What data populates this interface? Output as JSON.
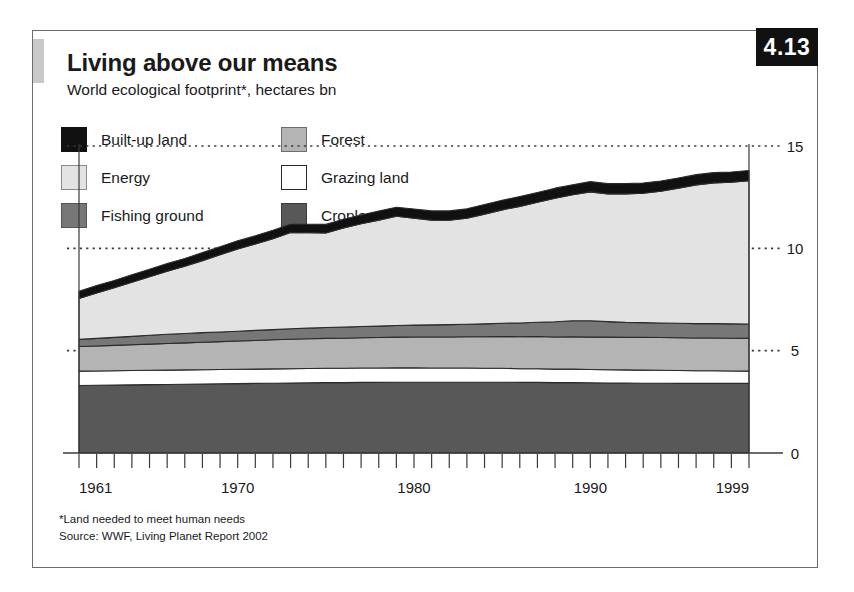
{
  "badge": {
    "number": "4.13"
  },
  "header": {
    "title": "Living above our means",
    "subtitle": "World ecological footprint*, hectares bn"
  },
  "legend": {
    "items": [
      {
        "label": "Built-up land",
        "color": "#111111",
        "border": "#111111"
      },
      {
        "label": "Forest",
        "color": "#b4b4b4",
        "border": "#6d6d6d"
      },
      {
        "label": "Energy",
        "color": "#e3e3e3",
        "border": "#8a8a8a"
      },
      {
        "label": "Grazing land",
        "color": "#ffffff",
        "border": "#2b2b2b"
      },
      {
        "label": "Fishing ground",
        "color": "#777777",
        "border": "#555555"
      },
      {
        "label": "Cropland",
        "color": "#585858",
        "border": "#3a3a3a"
      }
    ]
  },
  "footnotes": {
    "line1": "*Land needed to meet human needs",
    "line2": "Source: WWF, Living Planet Report 2002"
  },
  "chart_data": {
    "type": "area",
    "stacked": true,
    "title": "Living above our means",
    "subtitle": "World ecological footprint*, hectares bn",
    "xlabel": "",
    "ylabel": "hectares bn",
    "xlim": [
      1961,
      1999
    ],
    "ylim": [
      0,
      15
    ],
    "yticks": [
      0,
      5,
      10,
      15
    ],
    "ytick_labels": [
      "0",
      "5",
      "10",
      "15"
    ],
    "xticks": [
      1961,
      1970,
      1980,
      1990,
      1999
    ],
    "xtick_labels": [
      "1961",
      "1970",
      "1980",
      "1990",
      "1999"
    ],
    "xtick_minor_every": 1,
    "grid": "dotted-horizontal",
    "legend_position": "top-left-inside",
    "x": [
      1961,
      1962,
      1963,
      1964,
      1965,
      1966,
      1967,
      1968,
      1969,
      1970,
      1971,
      1972,
      1973,
      1974,
      1975,
      1976,
      1977,
      1978,
      1979,
      1980,
      1981,
      1982,
      1983,
      1984,
      1985,
      1986,
      1987,
      1988,
      1989,
      1990,
      1991,
      1992,
      1993,
      1994,
      1995,
      1996,
      1997,
      1998,
      1999
    ],
    "series": [
      {
        "name": "Cropland",
        "color": "#585858",
        "values": [
          3.3,
          3.31,
          3.32,
          3.33,
          3.34,
          3.35,
          3.36,
          3.37,
          3.38,
          3.39,
          3.4,
          3.41,
          3.42,
          3.43,
          3.44,
          3.44,
          3.45,
          3.45,
          3.46,
          3.46,
          3.46,
          3.46,
          3.46,
          3.46,
          3.46,
          3.45,
          3.45,
          3.44,
          3.44,
          3.43,
          3.42,
          3.42,
          3.41,
          3.41,
          3.4,
          3.4,
          3.4,
          3.4,
          3.4
        ]
      },
      {
        "name": "Grazing land",
        "color": "#ffffff",
        "values": [
          0.7,
          0.7,
          0.7,
          0.7,
          0.7,
          0.7,
          0.7,
          0.7,
          0.7,
          0.7,
          0.7,
          0.7,
          0.7,
          0.7,
          0.7,
          0.7,
          0.7,
          0.7,
          0.7,
          0.7,
          0.69,
          0.69,
          0.69,
          0.68,
          0.68,
          0.67,
          0.67,
          0.66,
          0.66,
          0.65,
          0.65,
          0.64,
          0.64,
          0.63,
          0.63,
          0.62,
          0.62,
          0.61,
          0.6
        ]
      },
      {
        "name": "Forest",
        "color": "#b4b4b4",
        "values": [
          1.2,
          1.22,
          1.24,
          1.26,
          1.28,
          1.3,
          1.32,
          1.34,
          1.36,
          1.38,
          1.4,
          1.42,
          1.44,
          1.45,
          1.46,
          1.47,
          1.48,
          1.49,
          1.5,
          1.51,
          1.52,
          1.52,
          1.53,
          1.54,
          1.55,
          1.56,
          1.57,
          1.57,
          1.58,
          1.58,
          1.59,
          1.59,
          1.6,
          1.6,
          1.6,
          1.6,
          1.6,
          1.6,
          1.6
        ]
      },
      {
        "name": "Fishing ground",
        "color": "#777777",
        "values": [
          0.35,
          0.37,
          0.39,
          0.41,
          0.43,
          0.45,
          0.46,
          0.47,
          0.47,
          0.48,
          0.49,
          0.5,
          0.51,
          0.52,
          0.53,
          0.54,
          0.55,
          0.56,
          0.57,
          0.58,
          0.59,
          0.6,
          0.61,
          0.63,
          0.65,
          0.67,
          0.7,
          0.74,
          0.78,
          0.8,
          0.76,
          0.73,
          0.72,
          0.71,
          0.71,
          0.7,
          0.7,
          0.7,
          0.7
        ]
      },
      {
        "name": "Energy",
        "color": "#e3e3e3",
        "values": [
          2.0,
          2.22,
          2.42,
          2.64,
          2.86,
          3.08,
          3.28,
          3.52,
          3.78,
          4.02,
          4.22,
          4.44,
          4.7,
          4.66,
          4.62,
          4.84,
          5.02,
          5.18,
          5.34,
          5.22,
          5.12,
          5.1,
          5.18,
          5.36,
          5.54,
          5.7,
          5.86,
          6.04,
          6.16,
          6.3,
          6.24,
          6.28,
          6.32,
          6.44,
          6.6,
          6.78,
          6.88,
          6.92,
          7.0
        ]
      },
      {
        "name": "Built-up land",
        "color": "#111111",
        "values": [
          0.35,
          0.36,
          0.36,
          0.37,
          0.37,
          0.38,
          0.38,
          0.39,
          0.39,
          0.4,
          0.4,
          0.41,
          0.41,
          0.42,
          0.42,
          0.43,
          0.43,
          0.44,
          0.44,
          0.45,
          0.45,
          0.46,
          0.46,
          0.47,
          0.47,
          0.48,
          0.48,
          0.49,
          0.49,
          0.5,
          0.5,
          0.5,
          0.5,
          0.5,
          0.5,
          0.5,
          0.5,
          0.5,
          0.5
        ]
      }
    ],
    "totals": [
      7.9,
      8.18,
      8.43,
      8.71,
      8.98,
      9.26,
      9.5,
      9.79,
      10.08,
      10.37,
      10.61,
      10.88,
      11.18,
      11.18,
      11.17,
      11.45,
      11.63,
      11.82,
      12.01,
      11.92,
      11.83,
      11.83,
      11.93,
      12.14,
      12.35,
      12.53,
      12.73,
      12.94,
      13.11,
      13.26,
      13.16,
      13.16,
      13.19,
      13.29,
      13.44,
      13.6,
      13.7,
      13.73,
      13.8
    ]
  }
}
